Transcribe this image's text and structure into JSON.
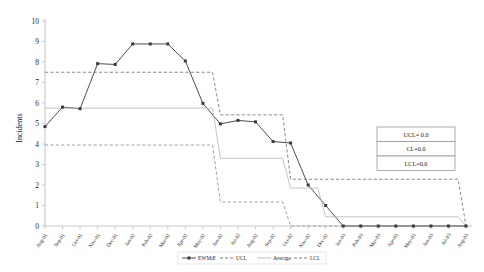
{
  "chart_data": {
    "type": "line",
    "title": "",
    "xlabel": "",
    "ylabel": "Incidents",
    "ylim": [
      0,
      10
    ],
    "yticks": [
      0,
      1,
      2,
      3,
      4,
      5,
      6,
      7,
      8,
      9,
      10
    ],
    "grid": false,
    "legend_position": "bottom",
    "categories": [
      "Aug-01",
      "Sep-01",
      "Oct-01",
      "Nov-01",
      "Dec-01",
      "Jan-02",
      "Feb-02",
      "Mar-02",
      "Apr-02",
      "May-02",
      "Jun-02",
      "Jul-02",
      "Aug-02",
      "Sep-02",
      "Oct-02",
      "Nov-02",
      "Dec-02",
      "Jan-03",
      "Feb-03",
      "Mar-03",
      "Apr-03",
      "May-03",
      "Jun-03",
      "Jul-03",
      "Aug-03"
    ],
    "series": [
      {
        "name": "EWMA",
        "style": "solid-marker",
        "color": "#3a3a3a",
        "values": [
          4.85,
          5.8,
          5.72,
          7.92,
          7.88,
          8.88,
          8.88,
          8.88,
          8.05,
          5.98,
          4.98,
          5.15,
          5.08,
          4.12,
          4.05,
          2.0,
          1.0,
          0.0,
          0.0,
          0.0,
          0.0,
          0.0,
          0.0,
          0.0,
          0.0
        ]
      },
      {
        "name": "UCL",
        "style": "dashed",
        "color": "#6b6b6b",
        "values": [
          7.5,
          7.5,
          7.5,
          7.5,
          7.5,
          7.5,
          7.5,
          7.5,
          7.5,
          7.5,
          5.42,
          5.42,
          5.42,
          5.42,
          2.28,
          2.28,
          2.28,
          2.28,
          2.28,
          2.28,
          2.28,
          2.28,
          2.28,
          2.28,
          0.0
        ]
      },
      {
        "name": "Average",
        "style": "solid-thin",
        "color": "#b5b5b5",
        "values": [
          5.75,
          5.75,
          5.75,
          5.75,
          5.75,
          5.75,
          5.75,
          5.75,
          5.75,
          5.75,
          3.3,
          3.3,
          3.3,
          3.3,
          1.85,
          1.85,
          0.45,
          0.45,
          0.45,
          0.45,
          0.45,
          0.45,
          0.45,
          0.45,
          0.0
        ]
      },
      {
        "name": "LCL",
        "style": "dashed",
        "color": "#8a8a8a",
        "values": [
          3.95,
          3.95,
          3.95,
          3.95,
          3.95,
          3.95,
          3.95,
          3.95,
          3.95,
          3.95,
          1.17,
          1.17,
          1.17,
          1.17,
          0.0,
          0.0,
          0.0,
          0.0,
          0.0,
          0.0,
          0.0,
          0.0,
          0.0,
          0.0,
          0.0
        ]
      }
    ],
    "annotations": {
      "box_lines": [
        "UCL= 0.0",
        "CL=0.0",
        "LCL=0.0"
      ]
    }
  },
  "legend": {
    "items": [
      {
        "label": "EWMıE",
        "style": "solid-marker"
      },
      {
        "label": "UCL",
        "style": "dashed"
      },
      {
        "label": "Average",
        "style": "solid-thin"
      },
      {
        "label": "LCL",
        "style": "dashed"
      }
    ]
  },
  "axis": {
    "y_title": "Incidents"
  },
  "colors": {
    "ewma": "#3a3a3a",
    "ucl": "#6b6b6b",
    "average": "#b5b5b5",
    "lcl": "#8a8a8a",
    "axis": "#c9c9c9",
    "text": "#1a1a1a"
  }
}
